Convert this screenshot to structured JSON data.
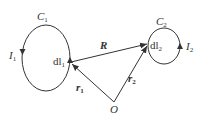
{
  "diagram": {
    "type": "physics-magnetic-interaction-two-current-loops",
    "loop1": {
      "curve": "C",
      "curve_sub": "1",
      "current": "I",
      "current_sub": "1",
      "element": "dl",
      "element_sub": "1"
    },
    "loop2": {
      "curve": "C",
      "curve_sub": "2",
      "current": "I",
      "current_sub": "2",
      "element": "dl",
      "element_sub": "2"
    },
    "vectors": {
      "R": {
        "label": "R"
      },
      "r1": {
        "label": "r",
        "sub": "1"
      },
      "r2": {
        "label": "r",
        "sub": "2"
      }
    },
    "origin": {
      "label": "O"
    },
    "colors": {
      "stroke": "#333333",
      "background": "#ffffff"
    }
  }
}
